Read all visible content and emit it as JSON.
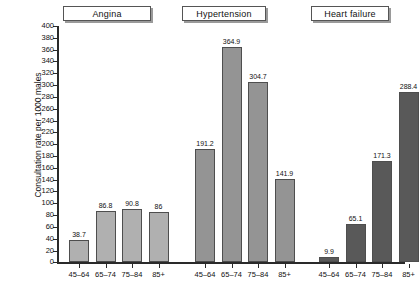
{
  "chart_data": {
    "type": "bar",
    "title": "",
    "xlabel": "",
    "ylabel": "Consultation rate per 1000 males",
    "ylim": [
      0,
      400
    ],
    "ytick_step": 20,
    "grid": false,
    "legend_position": "none",
    "categories": [
      "45–64",
      "65–74",
      "75–84",
      "85+"
    ],
    "groups": [
      {
        "name": "Angina",
        "color": "#b0b0b0",
        "categories": [
          "45–64",
          "65–74",
          "75–84",
          "85+"
        ],
        "values": [
          38.7,
          86.8,
          90.8,
          86
        ],
        "value_labels": [
          "38.7",
          "86.8",
          "90.8",
          "86"
        ]
      },
      {
        "name": "Hypertension",
        "color": "#949494",
        "categories": [
          "45–64",
          "65–74",
          "75–84",
          "85+"
        ],
        "values": [
          191.2,
          364.9,
          304.7,
          141.9
        ],
        "value_labels": [
          "191.2",
          "364.9",
          "304.7",
          "141.9"
        ]
      },
      {
        "name": "Heart failure",
        "color": "#595959",
        "categories": [
          "45–64",
          "65–74",
          "75–84",
          "85+"
        ],
        "values": [
          9.9,
          65.1,
          171.3,
          288.4
        ],
        "value_labels": [
          "9.9",
          "65.1",
          "171.3",
          "288.4"
        ]
      }
    ],
    "ytick_labels": [
      "0",
      "20",
      "40",
      "60",
      "80",
      "100",
      "120",
      "140",
      "160",
      "180",
      "200",
      "220",
      "240",
      "260",
      "280",
      "300",
      "320",
      "340",
      "360",
      "380",
      "400"
    ]
  },
  "axis": {
    "y_title": "Consultation rate per 1000 males"
  },
  "group_titles": {
    "angina": "Angina",
    "hypertension": "Hypertension",
    "heart_failure": "Heart failure"
  }
}
